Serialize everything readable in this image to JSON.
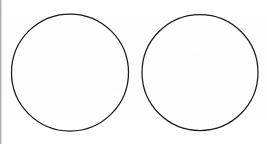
{
  "canvas": {
    "width": 267,
    "height": 144,
    "background_color": "#fefefe",
    "paper_tint_color": "#fdfdfd"
  },
  "edge_artifact": {
    "label": "left-edge-scan-strip",
    "x": 0,
    "width": 3,
    "color": "#3c3c3c"
  },
  "figure": {
    "title": "",
    "caption": "",
    "shape_count": 2,
    "shape_type": "circle",
    "stroke_color": "#1a1a1a",
    "stroke_width": 1.2,
    "fill": "none"
  },
  "shapes": [
    {
      "name": "left-circle",
      "type": "circle",
      "label": "",
      "cx": 70,
      "cy": 72.5,
      "r": 58.5,
      "stroke_color": "#1a1a1a",
      "stroke_width": 1.25,
      "fill": "none"
    },
    {
      "name": "right-circle",
      "type": "circle",
      "label": "",
      "cx": 200,
      "cy": 72.5,
      "r": 58.0,
      "stroke_color": "#1a1a1a",
      "stroke_width": 1.25,
      "fill": "none"
    }
  ]
}
